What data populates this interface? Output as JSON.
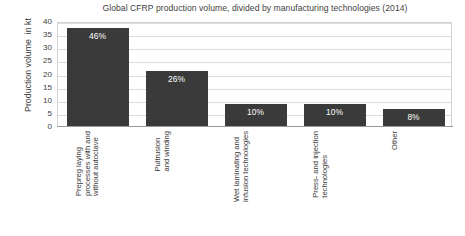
{
  "chart_data": {
    "type": "bar",
    "title": "Global CFRP production volume, divided by manufacturing technologies (2014)",
    "xlabel": "",
    "ylabel": "Production volume  in kt",
    "ylim": [
      0,
      40
    ],
    "yticks": [
      40,
      35,
      30,
      25,
      20,
      15,
      10,
      5,
      0
    ],
    "grid": true,
    "legend": "none",
    "categories": [
      "Prepreg laying\nprocesses with and\nwithout autoclave",
      "Pultrusion\nand winding",
      "Wet laminating and\ninfusion technologies",
      "Press- and injection\ntechnologies",
      "Other"
    ],
    "values": [
      37.5,
      21,
      8.5,
      8.5,
      6.5
    ],
    "data_labels": [
      "46%",
      "26%",
      "10%",
      "10%",
      "8%"
    ],
    "bar_color": "#3a3a3a",
    "data_label_color": "#ffffff",
    "gridline_color": "#dcdcdc",
    "plot_background": "#ffffff"
  }
}
